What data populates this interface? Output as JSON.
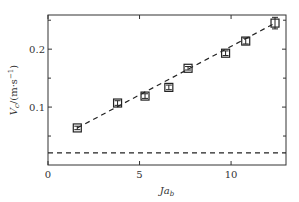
{
  "chart_data": {
    "type": "scatter",
    "title": "",
    "xlabel": "Ja_b",
    "ylabel": "V_c/(m·s⁻¹)",
    "xlim": [
      0,
      13
    ],
    "ylim": [
      0,
      0.259
    ],
    "xticks": [
      0,
      5,
      10
    ],
    "yticks": [
      0.1,
      0.2
    ],
    "y_minor_ticks": [
      0.05,
      0.15,
      0.25
    ],
    "grid": false,
    "legend": null,
    "series": [
      {
        "name": "measured",
        "marker": "open-square",
        "x": [
          1.6,
          3.8,
          5.3,
          6.6,
          7.65,
          9.7,
          10.8,
          12.4
        ],
        "y": [
          0.064,
          0.107,
          0.119,
          0.134,
          0.167,
          0.193,
          0.214,
          0.245
        ],
        "yerr": [
          0.003,
          0.004,
          0.004,
          0.004,
          0.003,
          0.004,
          0.005,
          0.01
        ]
      },
      {
        "name": "linear fit",
        "style": "dashed",
        "x": [
          1.6,
          12.4
        ],
        "y": [
          0.064,
          0.245
        ]
      },
      {
        "name": "horizontal reference",
        "style": "dashed",
        "x": [
          0,
          13
        ],
        "y": [
          0.021,
          0.021
        ]
      }
    ]
  },
  "axes": {
    "x_tick_labels": [
      "0",
      "5",
      "10"
    ],
    "y_tick_labels": [
      "0.1",
      "0.2"
    ],
    "xlabel_main": "Ja",
    "xlabel_sub": "b",
    "ylabel_main": "V",
    "ylabel_sub": "c",
    "ylabel_rest": "/(m·s",
    "ylabel_sup": "−1",
    "ylabel_close": ")"
  }
}
